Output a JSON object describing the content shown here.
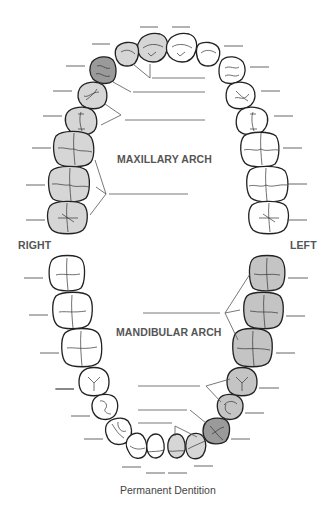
{
  "title": "Permanent Dentition",
  "labels": {
    "maxillary": "MAXILLARY ARCH",
    "mandibular": "MANDIBULAR ARCH",
    "right": "RIGHT",
    "left": "LEFT"
  },
  "colors": {
    "shade_light": "#d6d6d6",
    "shade_medium": "#c4c4c4",
    "shade_dark": "#9a9a9a",
    "unshaded": "#ffffff",
    "outline": "#222222",
    "text": "#555555"
  },
  "maxillary_teeth": [
    {
      "side": "right",
      "type": "third-molar",
      "shaded": "light"
    },
    {
      "side": "right",
      "type": "second-molar",
      "shaded": "light"
    },
    {
      "side": "right",
      "type": "first-molar",
      "shaded": "light"
    },
    {
      "side": "right",
      "type": "second-premolar",
      "shaded": "light"
    },
    {
      "side": "right",
      "type": "first-premolar",
      "shaded": "light"
    },
    {
      "side": "right",
      "type": "canine",
      "shaded": "dark"
    },
    {
      "side": "right",
      "type": "lateral-incisor",
      "shaded": "light"
    },
    {
      "side": "right",
      "type": "central-incisor",
      "shaded": "light"
    },
    {
      "side": "left",
      "type": "central-incisor",
      "shaded": "none"
    },
    {
      "side": "left",
      "type": "lateral-incisor",
      "shaded": "none"
    },
    {
      "side": "left",
      "type": "canine",
      "shaded": "none"
    },
    {
      "side": "left",
      "type": "first-premolar",
      "shaded": "none"
    },
    {
      "side": "left",
      "type": "second-premolar",
      "shaded": "none"
    },
    {
      "side": "left",
      "type": "first-molar",
      "shaded": "none"
    },
    {
      "side": "left",
      "type": "second-molar",
      "shaded": "none"
    },
    {
      "side": "left",
      "type": "third-molar",
      "shaded": "none"
    }
  ],
  "mandibular_teeth": [
    {
      "side": "right",
      "type": "third-molar",
      "shaded": "none"
    },
    {
      "side": "right",
      "type": "second-molar",
      "shaded": "none"
    },
    {
      "side": "right",
      "type": "first-molar",
      "shaded": "none"
    },
    {
      "side": "right",
      "type": "second-premolar",
      "shaded": "none"
    },
    {
      "side": "right",
      "type": "first-premolar",
      "shaded": "none"
    },
    {
      "side": "right",
      "type": "canine",
      "shaded": "none"
    },
    {
      "side": "right",
      "type": "lateral-incisor",
      "shaded": "none"
    },
    {
      "side": "right",
      "type": "central-incisor",
      "shaded": "none"
    },
    {
      "side": "left",
      "type": "central-incisor",
      "shaded": "light"
    },
    {
      "side": "left",
      "type": "lateral-incisor",
      "shaded": "light"
    },
    {
      "side": "left",
      "type": "canine",
      "shaded": "dark"
    },
    {
      "side": "left",
      "type": "first-premolar",
      "shaded": "light"
    },
    {
      "side": "left",
      "type": "second-premolar",
      "shaded": "light"
    },
    {
      "side": "left",
      "type": "first-molar",
      "shaded": "light"
    },
    {
      "side": "left",
      "type": "second-molar",
      "shaded": "light"
    },
    {
      "side": "left",
      "type": "third-molar",
      "shaded": "light"
    }
  ],
  "group_label_blanks": {
    "maxillary": [
      "incisors",
      "canine",
      "premolars",
      "molars"
    ],
    "mandibular": [
      "molars",
      "premolars",
      "canine",
      "incisors"
    ]
  }
}
